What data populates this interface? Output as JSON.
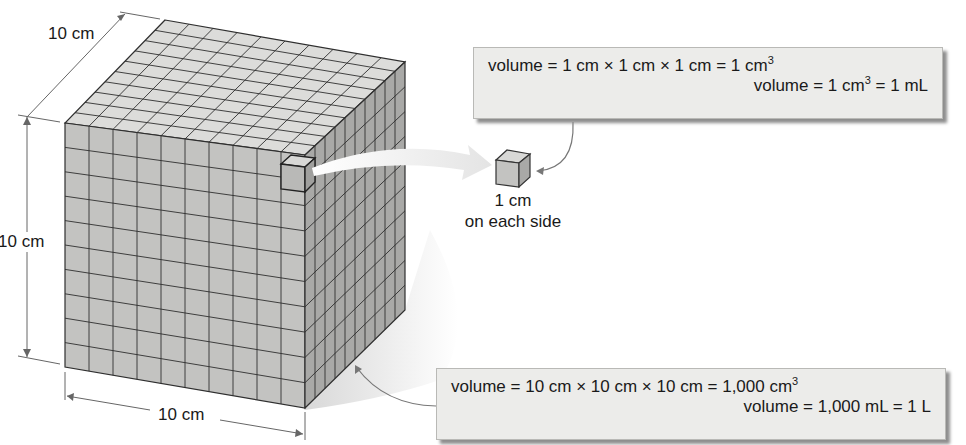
{
  "diagram": {
    "large_cube": {
      "depth_label": "10 cm",
      "height_label": "10 cm",
      "width_label": "10 cm",
      "grid_divisions": 10,
      "colors": {
        "top": "#dcdcda",
        "front": "#c3c3c1",
        "side": "#a9a9a7",
        "lines": "#2f2f2f"
      }
    },
    "small_cube": {
      "label_line1": "1 cm",
      "label_line2": "on each side"
    },
    "small_box": {
      "line1_prefix": "volume = 1 cm × 1 cm × 1 cm = 1 cm",
      "line1_exp": "3",
      "line2_prefix": "volume = 1 cm",
      "line2_exp": "3",
      "line2_suffix": " = 1 mL"
    },
    "large_box": {
      "line1_prefix": "volume = 10 cm × 10 cm × 10 cm = 1,000 cm",
      "line1_exp": "3",
      "line2": "volume = 1,000 mL = 1 L"
    }
  }
}
